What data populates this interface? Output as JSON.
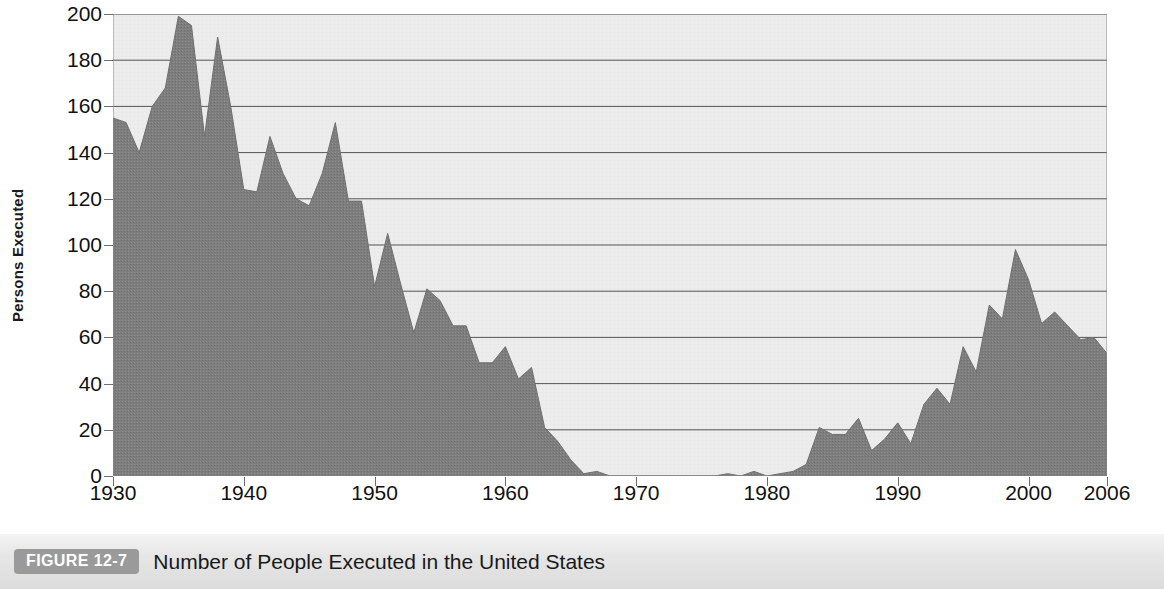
{
  "figure": {
    "badge_label": "FIGURE 12-7",
    "caption": "Number of People Executed in the United States"
  },
  "chart_data": {
    "type": "area",
    "title": "Number of People Executed in the United States",
    "xlabel": "",
    "ylabel": "Persons Executed",
    "xlim": [
      1930,
      2006
    ],
    "ylim": [
      0,
      200
    ],
    "grid": true,
    "legend": "none",
    "fill_color": "#808080",
    "plot_background": "#ececec",
    "gridline_color": "#555555",
    "y_ticks": [
      0,
      20,
      40,
      60,
      80,
      100,
      120,
      140,
      160,
      180,
      200
    ],
    "y_tick_labels": [
      "0",
      "20",
      "40",
      "60",
      "80",
      "100",
      "120",
      "140",
      "160",
      "180",
      "200"
    ],
    "x_ticks": [
      1930,
      1940,
      1950,
      1960,
      1970,
      1980,
      1990,
      2000,
      2006
    ],
    "x_tick_labels": [
      "1930",
      "1940",
      "1950",
      "1960",
      "1970",
      "1980",
      "1990",
      "2000",
      "2006"
    ],
    "x": [
      1930,
      1931,
      1932,
      1933,
      1934,
      1935,
      1936,
      1937,
      1938,
      1939,
      1940,
      1941,
      1942,
      1943,
      1944,
      1945,
      1946,
      1947,
      1948,
      1949,
      1950,
      1951,
      1952,
      1953,
      1954,
      1955,
      1956,
      1957,
      1958,
      1959,
      1960,
      1961,
      1962,
      1963,
      1964,
      1965,
      1966,
      1967,
      1968,
      1969,
      1970,
      1971,
      1972,
      1973,
      1974,
      1975,
      1976,
      1977,
      1978,
      1979,
      1980,
      1981,
      1982,
      1983,
      1984,
      1985,
      1986,
      1987,
      1988,
      1989,
      1990,
      1991,
      1992,
      1993,
      1994,
      1995,
      1996,
      1997,
      1998,
      1999,
      2000,
      2001,
      2002,
      2003,
      2004,
      2005,
      2006
    ],
    "values": [
      155,
      153,
      140,
      160,
      168,
      199,
      195,
      147,
      190,
      160,
      124,
      123,
      147,
      131,
      120,
      117,
      131,
      153,
      119,
      119,
      82,
      105,
      83,
      62,
      81,
      76,
      65,
      65,
      49,
      49,
      56,
      42,
      47,
      21,
      15,
      7,
      1,
      2,
      0,
      0,
      0,
      0,
      0,
      0,
      0,
      0,
      0,
      1,
      0,
      2,
      0,
      1,
      2,
      5,
      21,
      18,
      18,
      25,
      11,
      16,
      23,
      14,
      31,
      38,
      31,
      56,
      45,
      74,
      68,
      98,
      85,
      66,
      71,
      65,
      59,
      60,
      53
    ]
  }
}
